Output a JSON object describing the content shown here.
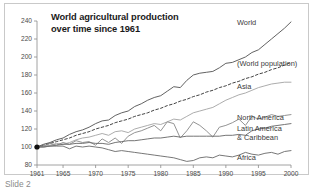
{
  "slide": {
    "caption": "Slide 2"
  },
  "chart_data": {
    "type": "line",
    "title": "World agricultural production over time since 1961",
    "title_line1": "World agricultural production",
    "title_line2": "over time since 1961",
    "xlabel": "",
    "ylabel": "",
    "xlim": [
      1961,
      2000
    ],
    "ylim": [
      80,
      240
    ],
    "grid": false,
    "legend_position": "right-inline",
    "xticks": [
      1961,
      1965,
      1970,
      1975,
      1980,
      1985,
      1990,
      1995,
      2000
    ],
    "xtick_labels": [
      "1961",
      "1965",
      "1970",
      "1975",
      "1980",
      "1985",
      "1990",
      "1995",
      "2000"
    ],
    "yticks": [
      80,
      100,
      120,
      140,
      160,
      180,
      200,
      220,
      240
    ],
    "ytick_labels": [
      "80",
      "100",
      "120",
      "140",
      "160",
      "180",
      "200",
      "220",
      "240"
    ],
    "x": [
      1961,
      1962,
      1963,
      1964,
      1965,
      1966,
      1967,
      1968,
      1969,
      1970,
      1971,
      1972,
      1973,
      1974,
      1975,
      1976,
      1977,
      1978,
      1979,
      1980,
      1981,
      1982,
      1983,
      1984,
      1985,
      1986,
      1987,
      1988,
      1989,
      1990,
      1991,
      1992,
      1993,
      1994,
      1995,
      1996,
      1997,
      1998,
      1999,
      2000
    ],
    "series": [
      {
        "name": "World",
        "color": "#5a5a5a",
        "style": "solid",
        "label": "World",
        "values": [
          100,
          103,
          105,
          108,
          110,
          114,
          117,
          119,
          122,
          126,
          129,
          130,
          135,
          138,
          140,
          145,
          148,
          152,
          155,
          157,
          162,
          167,
          166,
          174,
          180,
          182,
          183,
          184,
          188,
          193,
          194,
          197,
          200,
          205,
          208,
          214,
          220,
          226,
          232,
          239
        ]
      },
      {
        "name": "World population",
        "color": "#3a3a3a",
        "style": "dashed",
        "label": "(World population)",
        "values": [
          100,
          102,
          104,
          106,
          108,
          110,
          113,
          115,
          117,
          120,
          122,
          124,
          127,
          129,
          131,
          134,
          136,
          138,
          141,
          143,
          146,
          148,
          151,
          153,
          156,
          158,
          161,
          163,
          166,
          168,
          171,
          173,
          176,
          178,
          181,
          183,
          186,
          188,
          191,
          194
        ]
      },
      {
        "name": "Asia",
        "color": "#a8a8a8",
        "style": "solid",
        "label": "Asia",
        "values": [
          100,
          101,
          102,
          104,
          103,
          105,
          108,
          110,
          111,
          113,
          115,
          113,
          117,
          118,
          116,
          120,
          122,
          124,
          126,
          125,
          128,
          131,
          130,
          134,
          138,
          140,
          142,
          144,
          148,
          152,
          155,
          158,
          160,
          163,
          166,
          168,
          170,
          171,
          172,
          172
        ]
      },
      {
        "name": "North America",
        "color": "#8d8d8d",
        "style": "solid",
        "label": "North America",
        "values": [
          100,
          101,
          104,
          102,
          105,
          103,
          107,
          105,
          106,
          102,
          109,
          105,
          110,
          104,
          112,
          116,
          118,
          121,
          124,
          118,
          128,
          126,
          110,
          118,
          128,
          124,
          118,
          111,
          122,
          124,
          127,
          131,
          124,
          134,
          131,
          133,
          136,
          134,
          135,
          136
        ]
      },
      {
        "name": "Latin America & Caribbean",
        "color": "#6e6e6e",
        "style": "solid",
        "label_line1": "Latin America",
        "label_line2": "& Caribbean",
        "values": [
          100,
          100,
          101,
          102,
          103,
          103,
          104,
          104,
          105,
          104,
          104,
          103,
          105,
          106,
          107,
          107,
          108,
          109,
          110,
          110,
          111,
          112,
          111,
          112,
          112,
          112,
          112,
          112,
          112,
          113,
          113,
          114,
          113,
          118,
          120,
          121,
          123,
          124,
          125,
          126
        ]
      },
      {
        "name": "Africa",
        "color": "#707070",
        "style": "solid",
        "label": "Africa",
        "values": [
          100,
          100,
          101,
          101,
          101,
          98,
          101,
          100,
          101,
          100,
          99,
          97,
          95,
          96,
          95,
          94,
          93,
          92,
          91,
          90,
          89,
          88,
          86,
          84,
          85,
          88,
          89,
          88,
          91,
          90,
          89,
          91,
          94,
          92,
          91,
          93,
          94,
          92,
          95,
          96
        ]
      }
    ],
    "origin_marker": {
      "x": 1961,
      "y": 100
    }
  }
}
